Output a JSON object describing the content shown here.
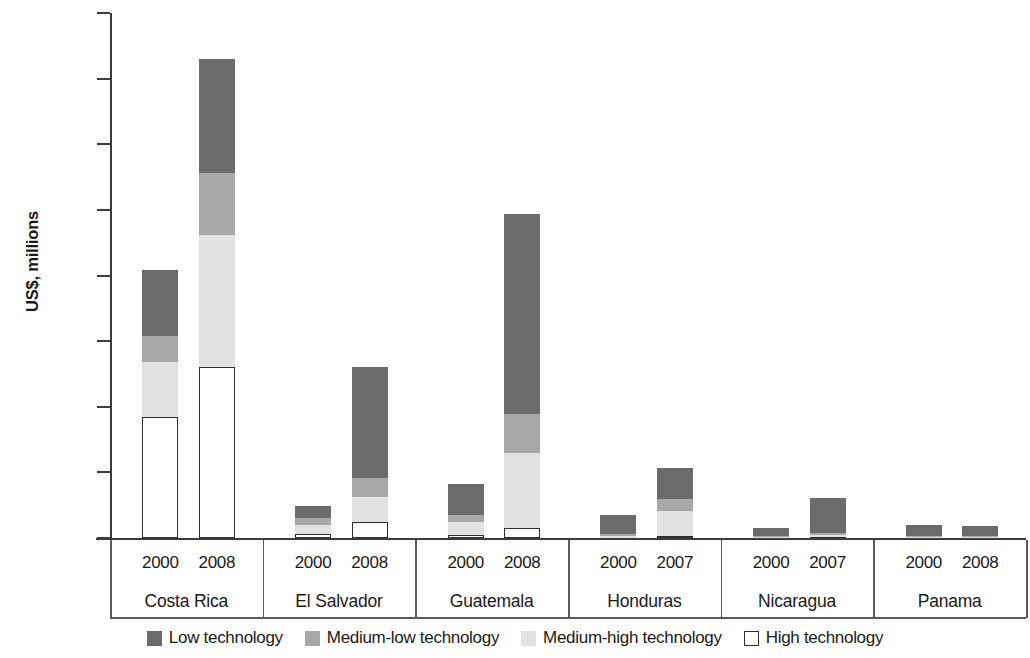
{
  "chart_data": {
    "type": "bar",
    "subtype": "stacked-bar",
    "title": "",
    "xlabel": "",
    "ylabel": "US$, millions",
    "ylim": [
      0,
      8000
    ],
    "ytick_values": [
      0,
      1000,
      2000,
      3000,
      4000,
      5000,
      6000,
      7000,
      8000
    ],
    "ytick_labels": [
      "0",
      "1,000",
      "2,000",
      "3,000",
      "4,000",
      "5,000",
      "6,000",
      "7,000",
      "8,000"
    ],
    "grid": false,
    "legend_position": "bottom",
    "stack_order_bottom_to_top": [
      "High technology",
      "Medium-high technology",
      "Medium-low technology",
      "Low technology"
    ],
    "series": [
      {
        "name": "Low technology",
        "color": "#6b6b6b",
        "values": [
          1000,
          1740,
          180,
          1680,
          480,
          3050,
          300,
          480,
          130,
          530,
          175,
          160
        ]
      },
      {
        "name": "Medium-low technology",
        "color": "#a8a8a8",
        "values": [
          400,
          940,
          110,
          290,
          110,
          590,
          25,
          180,
          10,
          40,
          10,
          10
        ]
      },
      {
        "name": "Medium-high technology",
        "color": "#e2e2e2",
        "values": [
          840,
          2020,
          140,
          380,
          190,
          1140,
          25,
          380,
          10,
          30,
          10,
          10
        ]
      },
      {
        "name": "High technology",
        "color": "#ffffff",
        "values": [
          1840,
          2600,
          55,
          250,
          50,
          160,
          5,
          30,
          5,
          10,
          5,
          5
        ]
      }
    ],
    "groups": [
      {
        "name": "Costa Rica",
        "bars": [
          {
            "year": "2000",
            "total": 4080,
            "segments": {
              "High technology": 1840,
              "Medium-high technology": 840,
              "Medium-low technology": 400,
              "Low technology": 1000
            }
          },
          {
            "year": "2008",
            "total": 7300,
            "segments": {
              "High technology": 2600,
              "Medium-high technology": 2020,
              "Medium-low technology": 940,
              "Low technology": 1740
            }
          }
        ]
      },
      {
        "name": "El Salvador",
        "bars": [
          {
            "year": "2000",
            "total": 485,
            "segments": {
              "High technology": 55,
              "Medium-high technology": 140,
              "Medium-low technology": 110,
              "Low technology": 180
            }
          },
          {
            "year": "2008",
            "total": 2600,
            "segments": {
              "High technology": 250,
              "Medium-high technology": 380,
              "Medium-low technology": 290,
              "Low technology": 1680
            }
          }
        ]
      },
      {
        "name": "Guatemala",
        "bars": [
          {
            "year": "2000",
            "total": 830,
            "segments": {
              "High technology": 50,
              "Medium-high technology": 190,
              "Medium-low technology": 110,
              "Low technology": 480
            }
          },
          {
            "year": "2008",
            "total": 4940,
            "segments": {
              "High technology": 160,
              "Medium-high technology": 1140,
              "Medium-low technology": 590,
              "Low technology": 3050
            }
          }
        ]
      },
      {
        "name": "Honduras",
        "bars": [
          {
            "year": "2000",
            "total": 355,
            "segments": {
              "High technology": 5,
              "Medium-high technology": 25,
              "Medium-low technology": 25,
              "Low technology": 300
            }
          },
          {
            "year": "2007",
            "total": 1070,
            "segments": {
              "High technology": 30,
              "Medium-high technology": 380,
              "Medium-low technology": 180,
              "Low technology": 480
            }
          }
        ]
      },
      {
        "name": "Nicaragua",
        "bars": [
          {
            "year": "2000",
            "total": 155,
            "segments": {
              "High technology": 5,
              "Medium-high technology": 10,
              "Medium-low technology": 10,
              "Low technology": 130
            }
          },
          {
            "year": "2007",
            "total": 610,
            "segments": {
              "High technology": 10,
              "Medium-high technology": 30,
              "Medium-low technology": 40,
              "Low technology": 530
            }
          }
        ]
      },
      {
        "name": "Panama",
        "bars": [
          {
            "year": "2000",
            "total": 200,
            "segments": {
              "High technology": 5,
              "Medium-high technology": 10,
              "Medium-low technology": 10,
              "Low technology": 175
            }
          },
          {
            "year": "2008",
            "total": 185,
            "segments": {
              "High technology": 5,
              "Medium-high technology": 10,
              "Medium-low technology": 10,
              "Low technology": 160
            }
          }
        ]
      }
    ]
  },
  "axis": {
    "y_title": "US$, millions"
  },
  "legend": {
    "items": [
      {
        "label": "Low technology",
        "swatch": "solid",
        "color": "#6b6b6b"
      },
      {
        "label": "Medium-low technology",
        "swatch": "solid",
        "color": "#a8a8a8"
      },
      {
        "label": "Medium-high technology",
        "swatch": "solid",
        "color": "#e2e2e2"
      },
      {
        "label": "High technology",
        "swatch": "outlined",
        "color": "#ffffff"
      }
    ]
  }
}
